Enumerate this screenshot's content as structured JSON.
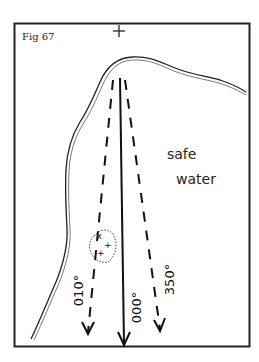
{
  "figure": {
    "label": "Fig 67",
    "region_label_line1": "safe",
    "region_label_line2": "water",
    "top_marker": "+",
    "bearings": [
      {
        "label": "010°",
        "style": "dashed"
      },
      {
        "label": "000°",
        "style": "solid"
      },
      {
        "label": "350°",
        "style": "dashed"
      }
    ],
    "hazard": {
      "type": "rocks",
      "marks": [
        "x",
        "+",
        "+"
      ]
    },
    "colors": {
      "ink": "#111111",
      "background": "#ffffff"
    }
  }
}
